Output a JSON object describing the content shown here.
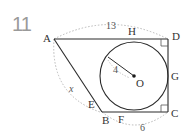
{
  "problem": {
    "number": "11"
  },
  "points": {
    "A": "A",
    "B": "B",
    "C": "C",
    "D": "D",
    "E": "E",
    "F": "F",
    "G": "G",
    "H": "H",
    "O": "O"
  },
  "measures": {
    "AD": "13",
    "BC": "6",
    "AB": "x",
    "radius": "4"
  },
  "colors": {
    "line": "#2a2a2a",
    "dotted": "#b0b0b0",
    "number": "#9a9a9a"
  }
}
